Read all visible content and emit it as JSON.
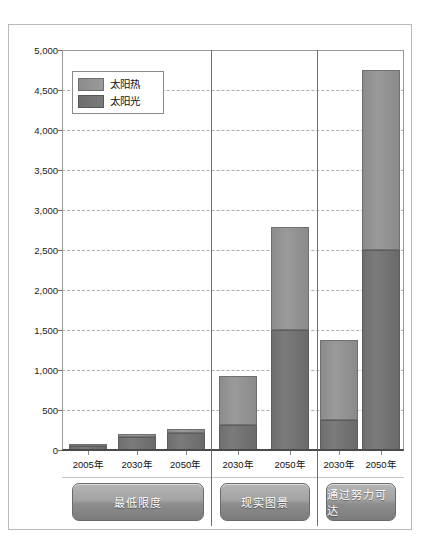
{
  "unit_label": "（TW/h）",
  "legend": {
    "items": [
      {
        "label": "太阳热",
        "key": "thermal",
        "color": "#939393"
      },
      {
        "label": "太阳光",
        "key": "pv",
        "color": "#747474"
      }
    ]
  },
  "chart_data": {
    "type": "bar",
    "stacked": true,
    "title": "",
    "xlabel": "",
    "ylabel": "（TW/h）",
    "ylim": [
      0,
      5000
    ],
    "ytick_values": [
      0,
      500,
      1000,
      1500,
      2000,
      2500,
      3000,
      3500,
      4000,
      4500,
      5000
    ],
    "ytick_labels": [
      "0",
      "500",
      "1,000",
      "1,500",
      "2,000",
      "2,500",
      "3,000",
      "3,500",
      "4,000",
      "4,500",
      "5,000"
    ],
    "grid": true,
    "legend_position": "upper-left-inside",
    "categories": [
      "2005年",
      "2030年",
      "2050年",
      "2030年",
      "2050年",
      "2030年",
      "2050年"
    ],
    "groups": [
      {
        "name": "最低限度",
        "bars": [
          {
            "x": "2005年",
            "pv": 45,
            "thermal": 5,
            "total": 50
          },
          {
            "x": "2030年",
            "pv": 165,
            "thermal": 40,
            "total": 205
          },
          {
            "x": "2050年",
            "pv": 215,
            "thermal": 50,
            "total": 265
          }
        ]
      },
      {
        "name": "现实图景",
        "bars": [
          {
            "x": "2030年",
            "pv": 310,
            "thermal": 620,
            "total": 930
          },
          {
            "x": "2050年",
            "pv": 1500,
            "thermal": 1290,
            "total": 2790
          }
        ]
      },
      {
        "name": "通过努力可达",
        "bars": [
          {
            "x": "2030年",
            "pv": 370,
            "thermal": 1010,
            "total": 1380
          },
          {
            "x": "2050年",
            "pv": 2500,
            "thermal": 2250,
            "total": 4750
          }
        ]
      }
    ],
    "series": [
      {
        "name": "太阳光",
        "values": [
          45,
          165,
          215,
          310,
          1500,
          370,
          2500
        ]
      },
      {
        "name": "太阳热",
        "values": [
          5,
          40,
          50,
          620,
          1290,
          1010,
          2250
        ]
      }
    ]
  },
  "scenario_labels": [
    "最低限度",
    "现实图景",
    "通过努力可达"
  ]
}
